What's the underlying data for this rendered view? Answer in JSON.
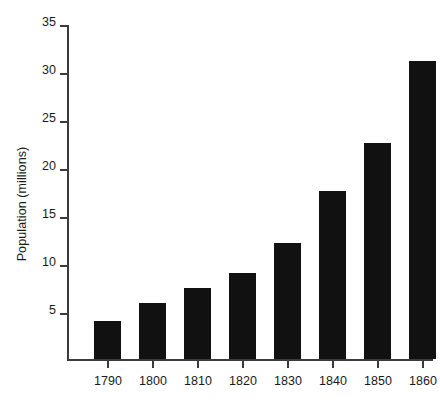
{
  "chart_data": {
    "type": "bar",
    "title": "",
    "subtitle": "",
    "xlabel": "",
    "ylabel": "Population (millions)",
    "categories": [
      "1790",
      "1800",
      "1810",
      "1820",
      "1830",
      "1840",
      "1850",
      "1860"
    ],
    "values": [
      4.0,
      5.8,
      7.4,
      9.0,
      12.1,
      17.5,
      22.5,
      31.0
    ],
    "series": [
      {
        "name": "Population",
        "values": [
          4.0,
          5.8,
          7.4,
          9.0,
          12.1,
          17.5,
          22.5,
          31.0
        ]
      }
    ],
    "ylim": [
      0,
      35
    ],
    "yticks": [
      0,
      5,
      10,
      15,
      20,
      25,
      30,
      35
    ],
    "ytick_labels": [
      "",
      "5",
      "10",
      "15",
      "20",
      "25",
      "30",
      "35"
    ],
    "xtick_labels": [
      "1790",
      "1800",
      "1810",
      "1820",
      "1830",
      "1840",
      "1850",
      "1860"
    ],
    "grid": false,
    "legend": false,
    "legend_position": "none",
    "bar_color": "#111111",
    "axis_color": "#3b3b3b",
    "background_color": "#ffffff",
    "text_color": "#1a1a1a"
  }
}
